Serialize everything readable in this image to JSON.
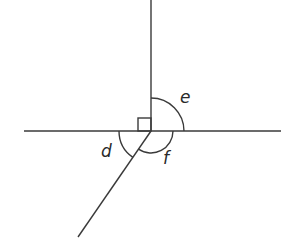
{
  "diagram": {
    "type": "angles-at-a-point",
    "stroke_color": "#3a3a3a",
    "center": [
      151,
      131
    ],
    "lines": [
      {
        "name": "horizontal-line",
        "from": [
          24,
          131
        ],
        "to": [
          281,
          131
        ]
      },
      {
        "name": "vertical-line",
        "from": [
          151,
          0
        ],
        "to": [
          151,
          131
        ]
      },
      {
        "name": "diagonal-line",
        "from": [
          151,
          131
        ],
        "to": [
          78,
          237
        ]
      }
    ],
    "right_angle_marker": {
      "x": 138,
      "y": 118,
      "size": 13
    },
    "angles": [
      {
        "label": "e",
        "radius": 33,
        "position": [
          180,
          89
        ]
      },
      {
        "label": "d",
        "radius": 32,
        "position": [
          101,
          143
        ]
      },
      {
        "label": "f",
        "radius": 22,
        "position": [
          163,
          150
        ]
      }
    ]
  }
}
